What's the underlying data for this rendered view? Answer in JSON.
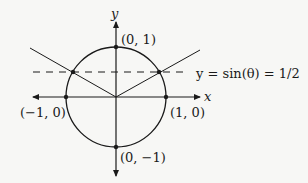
{
  "diagram": {
    "type": "unit-circle",
    "axes": {
      "x_label": "x",
      "y_label": "y"
    },
    "points": [
      {
        "id": "top",
        "label": "(0, 1)"
      },
      {
        "id": "bottom",
        "label": "(0, −1)"
      },
      {
        "id": "left",
        "label": "(−1, 0)"
      },
      {
        "id": "right",
        "label": "(1, 0)"
      }
    ],
    "horizontal_line": {
      "label": "y = sin(θ) = 1/2",
      "style": "dashed"
    },
    "colors": {
      "stroke": "#1a1a1a",
      "background": "#f7f7f5"
    }
  }
}
